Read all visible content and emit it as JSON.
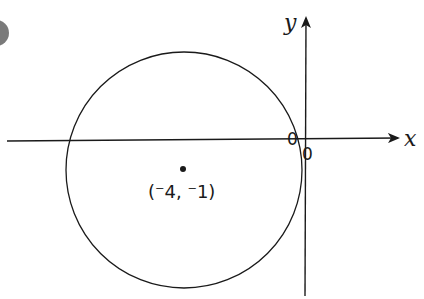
{
  "figure": {
    "badge": {
      "color": "#7a7a7a"
    },
    "axes": {
      "x_label": "x",
      "y_label": "y",
      "origin_labels": [
        "0",
        "0"
      ],
      "color": "#1a1a1a"
    },
    "circle": {
      "center_label": "(⁻4, ⁻1)",
      "center": [
        -4,
        -1
      ],
      "stroke": "#1a1a1a"
    }
  }
}
